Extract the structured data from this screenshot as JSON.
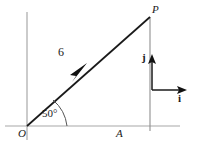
{
  "figure": {
    "type": "vector-diagram",
    "background_color": "#ffffff",
    "axis_color": "#a8a8a8",
    "vector_color": "#1a1a1a",
    "labels": {
      "point_p": "P",
      "origin_o": "O",
      "point_a": "A",
      "magnitude": "6",
      "angle": "50°",
      "basis_i": "i",
      "basis_j": "j"
    },
    "geometry": {
      "origin": [
        27,
        126
      ],
      "point_p": [
        150,
        17
      ],
      "point_a": [
        150,
        126
      ],
      "vector_magnitude": 6,
      "vector_angle_degrees": 50,
      "x_axis_from": [
        5,
        126
      ],
      "x_axis_to": [
        180,
        126
      ],
      "y_axis_from": [
        27,
        12
      ],
      "y_axis_to": [
        27,
        140
      ],
      "basis_corner": [
        152,
        90
      ],
      "basis_j_tip": [
        152,
        56
      ],
      "basis_i_tip": [
        186,
        90
      ],
      "arrowhead_on_vector": [
        80,
        70
      ]
    }
  }
}
